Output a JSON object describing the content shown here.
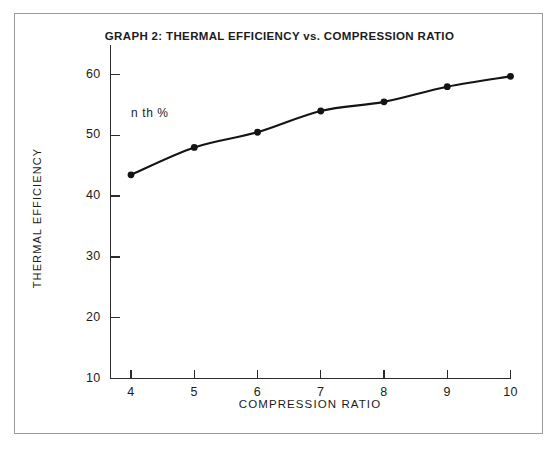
{
  "figure": {
    "frame_color": "#9a9a9a",
    "background": "#ffffff"
  },
  "chart_data": {
    "type": "line",
    "title": "GRAPH 2: THERMAL EFFICIENCY vs. COMPRESSION RATIO",
    "xlabel": "COMPRESSION RATIO",
    "ylabel": "THERMAL EFFICIENCY",
    "annotation": "n th %",
    "grid": false,
    "legend": null,
    "series_color": "#141414",
    "marker": "filled-circle",
    "xlim": [
      4,
      10
    ],
    "ylim": [
      10,
      60
    ],
    "xticks": [
      4,
      5,
      6,
      7,
      8,
      9,
      10
    ],
    "yticks": [
      10,
      20,
      30,
      40,
      50,
      60
    ],
    "xtick_labels": [
      "4",
      "5",
      "6",
      "7",
      "8",
      "9",
      "10"
    ],
    "ytick_labels": [
      "10",
      "20",
      "30",
      "40",
      "50",
      "60"
    ],
    "x": [
      4,
      5,
      6,
      7,
      8,
      9,
      10
    ],
    "values": [
      43.5,
      48.0,
      50.5,
      54.0,
      55.5,
      58.0,
      59.7
    ],
    "series": [
      {
        "name": "Thermal efficiency",
        "x": [
          4,
          5,
          6,
          7,
          8,
          9,
          10
        ],
        "values": [
          43.5,
          48.0,
          50.5,
          54.0,
          55.5,
          58.0,
          59.7
        ]
      }
    ]
  }
}
